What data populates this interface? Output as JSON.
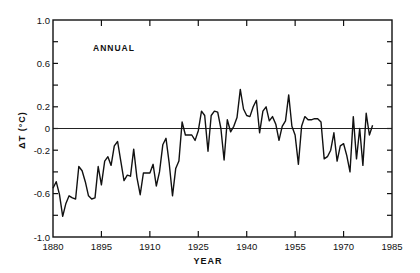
{
  "chart_data": {
    "type": "line",
    "title": "",
    "panel_label": "ANNUAL",
    "xlabel": "YEAR",
    "ylabel": "ΔT (°C)",
    "xlim": [
      1880,
      1985
    ],
    "ylim": [
      -1.0,
      1.0
    ],
    "x_ticks": [
      1880,
      1895,
      1910,
      1925,
      1940,
      1955,
      1970,
      1985
    ],
    "x_tick_labels": [
      "1880",
      "1895",
      "1910",
      "1925",
      "1940",
      "1955",
      "1970",
      "1985"
    ],
    "y_ticks": [
      1.0,
      0.6,
      0.2,
      0,
      -0.2,
      -0.6,
      -1.0
    ],
    "y_tick_labels": [
      "1.0",
      "0.6",
      "0.2",
      "0",
      "-0.2",
      "-0.6",
      "-1.0"
    ],
    "y_minor_ticks": [
      0.8,
      0.4,
      -0.4,
      -0.8
    ],
    "reference_line": 0,
    "grid": false,
    "legend": null,
    "series": [
      {
        "name": "Annual temperature anomaly",
        "x": [
          1880,
          1881,
          1882,
          1883,
          1884,
          1885,
          1886,
          1887,
          1888,
          1889,
          1890,
          1891,
          1892,
          1893,
          1894,
          1895,
          1896,
          1897,
          1898,
          1899,
          1900,
          1901,
          1902,
          1903,
          1904,
          1905,
          1906,
          1907,
          1908,
          1909,
          1910,
          1911,
          1912,
          1913,
          1914,
          1915,
          1916,
          1917,
          1918,
          1919,
          1920,
          1921,
          1922,
          1923,
          1924,
          1925,
          1926,
          1927,
          1928,
          1929,
          1930,
          1931,
          1932,
          1933,
          1934,
          1935,
          1936,
          1937,
          1938,
          1939,
          1940,
          1941,
          1942,
          1943,
          1944,
          1945,
          1946,
          1947,
          1948,
          1949,
          1950,
          1951,
          1952,
          1953,
          1954,
          1955,
          1956,
          1957,
          1958,
          1959,
          1960,
          1961,
          1962,
          1963,
          1964,
          1965,
          1966,
          1967,
          1968,
          1969,
          1970,
          1971,
          1972,
          1973,
          1974,
          1975,
          1976,
          1977,
          1978,
          1979
        ],
        "values": [
          -0.55,
          -0.49,
          -0.61,
          -0.81,
          -0.69,
          -0.62,
          -0.64,
          -0.65,
          -0.35,
          -0.39,
          -0.49,
          -0.62,
          -0.65,
          -0.64,
          -0.35,
          -0.52,
          -0.3,
          -0.26,
          -0.34,
          -0.16,
          -0.12,
          -0.3,
          -0.48,
          -0.43,
          -0.44,
          -0.19,
          -0.45,
          -0.61,
          -0.41,
          -0.41,
          -0.41,
          -0.33,
          -0.53,
          -0.4,
          -0.15,
          -0.09,
          -0.32,
          -0.62,
          -0.37,
          -0.3,
          0.06,
          -0.06,
          -0.06,
          -0.06,
          -0.11,
          -0.02,
          0.16,
          0.12,
          -0.21,
          0.12,
          0.16,
          0.15,
          0.0,
          -0.29,
          0.08,
          -0.03,
          0.02,
          0.1,
          0.36,
          0.18,
          0.12,
          0.11,
          0.2,
          0.26,
          -0.04,
          0.16,
          0.2,
          0.07,
          0.11,
          0.04,
          -0.11,
          0.02,
          0.07,
          0.31,
          0.02,
          -0.06,
          -0.33,
          0.02,
          0.11,
          0.08,
          0.08,
          0.09,
          0.09,
          0.06,
          -0.28,
          -0.26,
          -0.2,
          -0.04,
          -0.3,
          -0.16,
          -0.14,
          -0.25,
          -0.4,
          0.11,
          -0.28,
          0.0,
          -0.34,
          0.14,
          -0.06,
          0.03
        ],
        "color": "#111111"
      }
    ]
  }
}
